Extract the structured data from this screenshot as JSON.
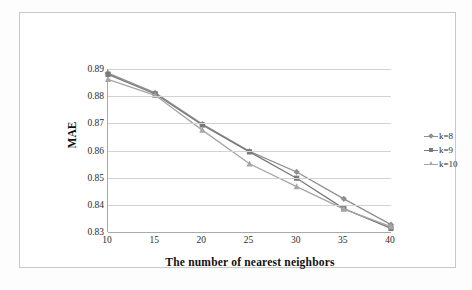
{
  "chart_data": {
    "type": "line",
    "title": "",
    "xlabel": "The number of nearest neighbors",
    "ylabel": "MAE",
    "x": [
      10,
      15,
      20,
      25,
      30,
      35,
      40
    ],
    "xticklabels": [
      "10",
      "15",
      "20",
      "25",
      "30",
      "35",
      "40"
    ],
    "yticklabels": [
      "0.89",
      "0.88",
      "0.87",
      "0.86",
      "0.85",
      "0.84",
      "0.83"
    ],
    "yticks": [
      0.89,
      0.88,
      0.87,
      0.86,
      0.85,
      0.84,
      0.83
    ],
    "xlim": [
      10,
      40
    ],
    "ylim": [
      0.83,
      0.89
    ],
    "grid": "horizontal",
    "legend_position": "right-outside",
    "series": [
      {
        "name": "k=8",
        "marker": "diamond",
        "color": "#8f8f8f",
        "values": [
          0.8885,
          0.8812,
          0.8697,
          0.8597,
          0.8521,
          0.8422,
          0.8327
        ]
      },
      {
        "name": "k=9",
        "marker": "square",
        "color": "#7a7a7a",
        "values": [
          0.888,
          0.8808,
          0.8694,
          0.8595,
          0.8498,
          0.8386,
          0.8313
        ]
      },
      {
        "name": "k=10",
        "marker": "triangle",
        "color": "#a6a6a6",
        "values": [
          0.8862,
          0.8803,
          0.8675,
          0.8551,
          0.8467,
          0.8384,
          0.832
        ]
      }
    ]
  },
  "legend": {
    "items": [
      {
        "label": "k=8"
      },
      {
        "label": "k=9"
      },
      {
        "label": "k=10"
      }
    ]
  },
  "colors": {
    "grid": "#d2d2d2",
    "axis": "#a9a9a9",
    "frame": "#c8c8c8",
    "text": "#2b2b2b",
    "title_text": "#111111"
  }
}
